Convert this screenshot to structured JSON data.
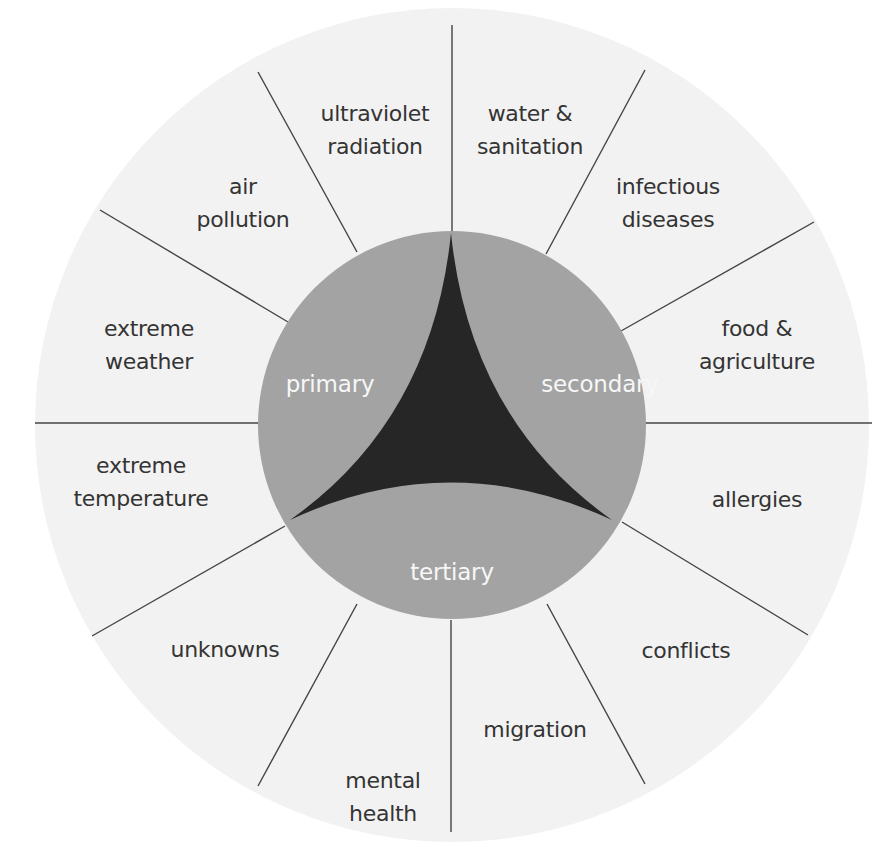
{
  "diagram": {
    "colors": {
      "outer_ring": "#f2f2f2",
      "inner_circle": "#a3a3a3",
      "core_triangle": "#262626",
      "divider_lines": "#444444",
      "label_text": "#343434",
      "inner_label_text": "#f7f7f7"
    },
    "inner_levels": [
      {
        "label": "primary"
      },
      {
        "label": "secondary"
      },
      {
        "label": "tertiary"
      }
    ],
    "segments": [
      {
        "line1": "ultraviolet",
        "line2": "radiation"
      },
      {
        "line1": "water &",
        "line2": "sanitation"
      },
      {
        "line1": "infectious",
        "line2": "diseases"
      },
      {
        "line1": "food &",
        "line2": "agriculture"
      },
      {
        "line1": "allergies",
        "line2": ""
      },
      {
        "line1": "conflicts",
        "line2": ""
      },
      {
        "line1": "migration",
        "line2": ""
      },
      {
        "line1": "mental",
        "line2": "health"
      },
      {
        "line1": "unknowns",
        "line2": ""
      },
      {
        "line1": "extreme",
        "line2": "temperature"
      },
      {
        "line1": "extreme",
        "line2": "weather"
      },
      {
        "line1": "air",
        "line2": "pollution"
      }
    ]
  }
}
